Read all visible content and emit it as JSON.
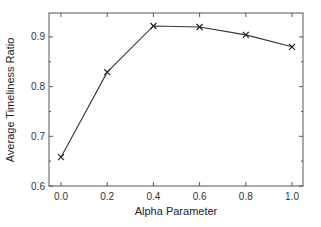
{
  "chart_data": {
    "type": "line",
    "title": "",
    "xlabel": "Alpha Parameter",
    "ylabel": "Average Timeliness Ratio",
    "x": [
      0.0,
      0.2,
      0.4,
      0.6,
      0.8,
      1.0
    ],
    "series": [
      {
        "name": "Average Timeliness Ratio",
        "marker": "x",
        "values": [
          0.658,
          0.829,
          0.922,
          0.92,
          0.904,
          0.88
        ]
      }
    ],
    "xlim": [
      -0.05,
      1.05
    ],
    "ylim": [
      0.6,
      0.95
    ],
    "xticks": [
      "0.0",
      "0.2",
      "0.4",
      "0.6",
      "0.8",
      "1.0"
    ],
    "yticks": [
      "0.6",
      "0.7",
      "0.8",
      "0.9"
    ],
    "grid": false,
    "legend": null,
    "colors": {
      "line": "#333333",
      "axis": "#555555"
    }
  }
}
